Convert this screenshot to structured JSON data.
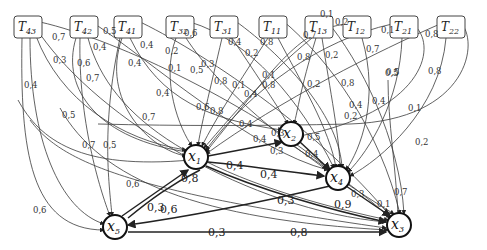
{
  "diagram": {
    "type": "weighted directed graph",
    "t_nodes": [
      {
        "id": "T43",
        "base": "T",
        "sub": "43",
        "x": 27,
        "y": 27
      },
      {
        "id": "T42",
        "base": "T",
        "sub": "42",
        "x": 83,
        "y": 27
      },
      {
        "id": "T41",
        "base": "T",
        "sub": "41",
        "x": 127,
        "y": 27
      },
      {
        "id": "T32",
        "base": "T",
        "sub": "32",
        "x": 181,
        "y": 27
      },
      {
        "id": "T31",
        "base": "T",
        "sub": "31",
        "x": 225,
        "y": 27
      },
      {
        "id": "T11",
        "base": "T",
        "sub": "11",
        "x": 273,
        "y": 27
      },
      {
        "id": "T13",
        "base": "T",
        "sub": "13",
        "x": 319,
        "y": 27
      },
      {
        "id": "T12",
        "base": "T",
        "sub": "12",
        "x": 356,
        "y": 27
      },
      {
        "id": "T21",
        "base": "T",
        "sub": "21",
        "x": 402,
        "y": 27
      },
      {
        "id": "T22",
        "base": "T",
        "sub": "22",
        "x": 450,
        "y": 27
      }
    ],
    "x_nodes": [
      {
        "id": "x1",
        "base": "x",
        "sub": "1",
        "x": 196,
        "y": 157
      },
      {
        "id": "x2",
        "base": "x",
        "sub": "2",
        "x": 291,
        "y": 134
      },
      {
        "id": "x4",
        "base": "x",
        "sub": "4",
        "x": 338,
        "y": 178
      },
      {
        "id": "x5",
        "base": "x",
        "sub": "5",
        "x": 115,
        "y": 227
      },
      {
        "id": "x3",
        "base": "x",
        "sub": "3",
        "x": 399,
        "y": 225
      }
    ],
    "edge_labels": [
      {
        "text": "0,7",
        "x": 52,
        "y": 40
      },
      {
        "text": "0,3",
        "x": 53,
        "y": 63
      },
      {
        "text": "0,6",
        "x": 77,
        "y": 66
      },
      {
        "text": "0,7",
        "x": 86,
        "y": 81
      },
      {
        "text": "0,4",
        "x": 93,
        "y": 50
      },
      {
        "text": "0,5",
        "x": 103,
        "y": 34
      },
      {
        "text": "0,4",
        "x": 140,
        "y": 48
      },
      {
        "text": "0,4",
        "x": 128,
        "y": 66
      },
      {
        "text": "0,4",
        "x": 24,
        "y": 88
      },
      {
        "text": "0,5",
        "x": 62,
        "y": 118
      },
      {
        "text": "0,7",
        "x": 142,
        "y": 120
      },
      {
        "text": "0,5",
        "x": 103,
        "y": 148
      },
      {
        "text": "0,6",
        "x": 126,
        "y": 187
      },
      {
        "text": "0,6",
        "x": 33,
        "y": 213
      },
      {
        "text": "0,7",
        "x": 82,
        "y": 148
      },
      {
        "text": "0,2",
        "x": 165,
        "y": 54
      },
      {
        "text": "0,1",
        "x": 168,
        "y": 71
      },
      {
        "text": "0,5",
        "x": 190,
        "y": 73
      },
      {
        "text": "0,6",
        "x": 184,
        "y": 36
      },
      {
        "text": "0,3",
        "x": 201,
        "y": 67
      },
      {
        "text": "0,4",
        "x": 228,
        "y": 45
      },
      {
        "text": "0,2",
        "x": 245,
        "y": 56
      },
      {
        "text": "0,8",
        "x": 260,
        "y": 45
      },
      {
        "text": "0,1",
        "x": 262,
        "y": 78
      },
      {
        "text": "0,8",
        "x": 262,
        "y": 88
      },
      {
        "text": "0,8",
        "x": 214,
        "y": 84
      },
      {
        "text": "0,1",
        "x": 232,
        "y": 88
      },
      {
        "text": "0,4",
        "x": 156,
        "y": 96
      },
      {
        "text": "0,6",
        "x": 196,
        "y": 110
      },
      {
        "text": "0,8",
        "x": 210,
        "y": 114
      },
      {
        "text": "0,4",
        "x": 244,
        "y": 97
      },
      {
        "text": "0,4",
        "x": 239,
        "y": 127
      },
      {
        "text": "0,4",
        "x": 253,
        "y": 142
      },
      {
        "text": "0,3",
        "x": 271,
        "y": 136
      },
      {
        "text": "0,3",
        "x": 270,
        "y": 154
      },
      {
        "text": "0,1",
        "x": 320,
        "y": 17
      },
      {
        "text": "0,7",
        "x": 303,
        "y": 38
      },
      {
        "text": "0,8",
        "x": 297,
        "y": 60
      },
      {
        "text": "0,2",
        "x": 325,
        "y": 58
      },
      {
        "text": "0,2",
        "x": 307,
        "y": 87
      },
      {
        "text": "0,8",
        "x": 341,
        "y": 86
      },
      {
        "text": "0,4",
        "x": 349,
        "y": 108
      },
      {
        "text": "0,2",
        "x": 344,
        "y": 119
      },
      {
        "text": "0,4",
        "x": 372,
        "y": 104
      },
      {
        "text": "0,5",
        "x": 385,
        "y": 76
      },
      {
        "text": "0,5",
        "x": 307,
        "y": 140
      },
      {
        "text": "0,4",
        "x": 305,
        "y": 157
      },
      {
        "text": "0,2",
        "x": 335,
        "y": 25
      },
      {
        "text": "0,7",
        "x": 366,
        "y": 52
      },
      {
        "text": "0,1",
        "x": 381,
        "y": 33
      },
      {
        "text": "0,8",
        "x": 425,
        "y": 37
      },
      {
        "text": "0,5",
        "x": 386,
        "y": 75
      },
      {
        "text": "0,8",
        "x": 428,
        "y": 74
      },
      {
        "text": "0,1",
        "x": 408,
        "y": 111
      },
      {
        "text": "0,2",
        "x": 415,
        "y": 145
      },
      {
        "text": "0,7",
        "x": 394,
        "y": 195
      },
      {
        "text": "0,3",
        "x": 351,
        "y": 197
      },
      {
        "text": "0,1",
        "x": 377,
        "y": 207
      }
    ],
    "bold_labels": [
      {
        "text": "0,4",
        "x": 226,
        "y": 169
      },
      {
        "text": "0,4",
        "x": 260,
        "y": 178
      },
      {
        "text": "0,8",
        "x": 181,
        "y": 182
      },
      {
        "text": "0,3",
        "x": 147,
        "y": 211
      },
      {
        "text": "0,6",
        "x": 160,
        "y": 213
      },
      {
        "text": "0,3",
        "x": 277,
        "y": 204
      },
      {
        "text": "0,9",
        "x": 334,
        "y": 208
      },
      {
        "text": "0,3",
        "x": 208,
        "y": 236
      },
      {
        "text": "0,8",
        "x": 290,
        "y": 236
      }
    ]
  }
}
